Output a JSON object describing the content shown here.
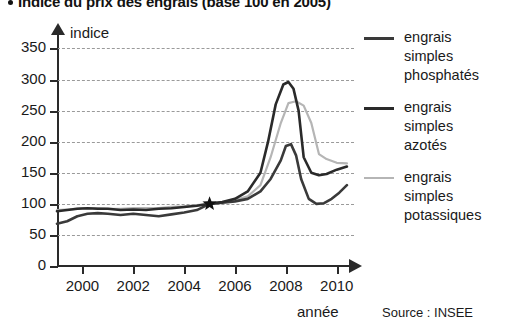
{
  "title": {
    "bullet": "•",
    "text": "Indice du prix des engrais (base 100 en 2005)"
  },
  "source": "Source : INSEE",
  "axis": {
    "y_name": "indice",
    "x_name": "année"
  },
  "legend": [
    {
      "label_l1": "engrais",
      "label_l2": "simples",
      "label_l3": "phosphatés",
      "color": "#3a3a3a"
    },
    {
      "label_l1": "engrais",
      "label_l2": "simples",
      "label_l3": "azotés",
      "color": "#2a2a2a"
    },
    {
      "label_l1": "engrais",
      "label_l2": "simples",
      "label_l3": "potassiques",
      "color": "#b5b5b5"
    }
  ],
  "chart_data": {
    "type": "line",
    "title": "Indice du prix des engrais (base 100 en 2005)",
    "xlabel": "année",
    "ylabel": "indice",
    "xlim": [
      1999,
      2010.6
    ],
    "ylim": [
      0,
      370
    ],
    "yticks": [
      0,
      50,
      100,
      150,
      200,
      250,
      300,
      350
    ],
    "xticks": [
      2000,
      2002,
      2004,
      2006,
      2008,
      2010
    ],
    "grid": "horizontal-dashed",
    "legend_position": "right",
    "annotations": [
      {
        "label": "base 100 en 2005",
        "marker": "star",
        "x": 2005.0,
        "y": 100
      }
    ],
    "series": [
      {
        "name": "engrais simples phosphatés",
        "color": "#3a3a3a",
        "x": [
          1999.0,
          1999.4,
          1999.8,
          2000.2,
          2000.6,
          2001.0,
          2001.5,
          2002.0,
          2002.5,
          2003.0,
          2003.5,
          2004.0,
          2004.5,
          2005.0,
          2005.5,
          2006.0,
          2006.5,
          2007.0,
          2007.4,
          2007.8,
          2008.0,
          2008.2,
          2008.4,
          2008.6,
          2008.9,
          2009.2,
          2009.5,
          2009.8,
          2010.1,
          2010.4
        ],
        "values": [
          68,
          72,
          80,
          84,
          85,
          84,
          82,
          84,
          82,
          80,
          83,
          86,
          90,
          100,
          102,
          104,
          108,
          120,
          140,
          170,
          193,
          196,
          178,
          140,
          108,
          100,
          101,
          108,
          118,
          130
        ]
      },
      {
        "name": "engrais simples azotés",
        "color": "#2a2a2a",
        "x": [
          1999.0,
          1999.4,
          1999.8,
          2000.2,
          2000.6,
          2001.0,
          2001.5,
          2002.0,
          2002.5,
          2003.0,
          2003.5,
          2004.0,
          2004.5,
          2005.0,
          2005.5,
          2006.0,
          2006.5,
          2007.0,
          2007.3,
          2007.6,
          2007.9,
          2008.1,
          2008.3,
          2008.5,
          2008.7,
          2009.0,
          2009.3,
          2009.6,
          2010.0,
          2010.4
        ],
        "values": [
          88,
          90,
          92,
          93,
          92,
          92,
          90,
          91,
          90,
          92,
          93,
          95,
          97,
          100,
          103,
          108,
          120,
          150,
          200,
          260,
          292,
          296,
          285,
          250,
          175,
          150,
          146,
          148,
          155,
          160
        ]
      },
      {
        "name": "engrais simples potassiques",
        "color": "#b5b5b5",
        "x": [
          1999.0,
          1999.5,
          2000.0,
          2000.5,
          2001.0,
          2001.5,
          2002.0,
          2002.5,
          2003.0,
          2003.5,
          2004.0,
          2004.5,
          2005.0,
          2005.5,
          2006.0,
          2006.5,
          2007.0,
          2007.4,
          2007.8,
          2008.1,
          2008.4,
          2008.7,
          2009.0,
          2009.3,
          2009.6,
          2010.0,
          2010.4
        ],
        "values": [
          90,
          91,
          93,
          93,
          92,
          92,
          93,
          93,
          93,
          95,
          96,
          98,
          100,
          103,
          106,
          112,
          130,
          175,
          230,
          262,
          265,
          258,
          230,
          180,
          172,
          166,
          165
        ]
      }
    ]
  }
}
